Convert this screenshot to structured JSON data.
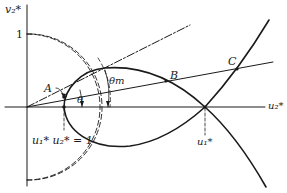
{
  "figure": {
    "type": "geometric diagram",
    "axes": {
      "y_label": "v₂*",
      "x_label": "u₂*",
      "y_tick_label": "1"
    },
    "points": {
      "A": "A",
      "B": "B",
      "C": "C"
    },
    "angles": {
      "theta": "θ",
      "theta_m": "θm"
    },
    "annotations": {
      "product_label": "u₁* u₂* = 1",
      "u1_star": "u₁*"
    },
    "colors": {
      "stroke": "#1a1a1a",
      "background": "#ffffff"
    }
  }
}
